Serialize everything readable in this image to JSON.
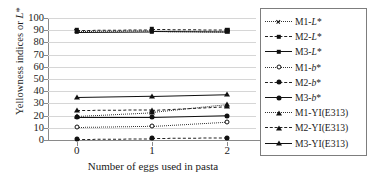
{
  "chart_data": {
    "type": "line",
    "title": "",
    "xlabel": "Number of eggs used in pasta",
    "ylabel": "Yellowness indices or L*",
    "x": [
      0,
      1,
      2
    ],
    "xticklabels": [
      "0",
      "1",
      "2"
    ],
    "yticklabels": [
      "0",
      "10",
      "20",
      "30",
      "40",
      "50",
      "60",
      "70",
      "80",
      "90",
      "100"
    ],
    "ylim": [
      0,
      100
    ],
    "xlim": [
      -0.38,
      2.38
    ],
    "grid": true,
    "legend_position": "right",
    "series": [
      {
        "name": "M1-L*",
        "values": [
          89.0,
          89.5,
          89.0
        ],
        "linestyle": "dotted",
        "marker": "x"
      },
      {
        "name": "M2-L*",
        "values": [
          90.5,
          91.0,
          90.5
        ],
        "linestyle": "dashed",
        "marker": "square"
      },
      {
        "name": "M3-L*",
        "values": [
          88.5,
          89.0,
          88.5
        ],
        "linestyle": "solid",
        "marker": "square"
      },
      {
        "name": "M1-b*",
        "values": [
          10.5,
          11.5,
          15.0
        ],
        "linestyle": "dotted",
        "marker": "circle"
      },
      {
        "name": "M2-b*",
        "values": [
          1.0,
          1.5,
          2.0
        ],
        "linestyle": "dashed",
        "marker": "circle-filled"
      },
      {
        "name": "M3-b*",
        "values": [
          18.5,
          18.5,
          20.0
        ],
        "linestyle": "solid",
        "marker": "circle-filled"
      },
      {
        "name": "M1-YI(E313)",
        "values": [
          20.0,
          23.0,
          29.5
        ],
        "linestyle": "dotted",
        "marker": "triangle"
      },
      {
        "name": "M2-YI(E313)",
        "values": [
          24.5,
          25.0,
          28.0
        ],
        "linestyle": "dashed",
        "marker": "triangle"
      },
      {
        "name": "M3-YI(E313)",
        "values": [
          35.0,
          36.0,
          37.5
        ],
        "linestyle": "solid",
        "marker": "triangle"
      }
    ]
  },
  "axes": {
    "y_title_main": "Yellowness indices or ",
    "y_title_italic": "L",
    "y_title_star": "*",
    "x_title": "Number of eggs used in pasta"
  },
  "legend": {
    "entries": [
      {
        "prefix": "M1-",
        "italic": "L",
        "star": "*",
        "suffix": "",
        "key_line": "dotted",
        "key_marker": "x"
      },
      {
        "prefix": "M2-",
        "italic": "L",
        "star": "*",
        "suffix": "",
        "key_line": "dashed",
        "key_marker": "square"
      },
      {
        "prefix": "M3-",
        "italic": "L",
        "star": "*",
        "suffix": "",
        "key_line": "solid",
        "key_marker": "square"
      },
      {
        "prefix": "M1-",
        "italic": "b",
        "star": "*",
        "suffix": "",
        "key_line": "dotted",
        "key_marker": "circle"
      },
      {
        "prefix": "M2-",
        "italic": "b",
        "star": "*",
        "suffix": "",
        "key_line": "dashed",
        "key_marker": "circle-filled"
      },
      {
        "prefix": "M3-",
        "italic": "b",
        "star": "*",
        "suffix": "",
        "key_line": "solid",
        "key_marker": "circle-filled"
      },
      {
        "prefix": "M1-YI(E313)",
        "italic": "",
        "star": "",
        "suffix": "",
        "key_line": "dotted",
        "key_marker": "triangle"
      },
      {
        "prefix": "M2-YI(E313)",
        "italic": "",
        "star": "",
        "suffix": "",
        "key_line": "dashed",
        "key_marker": "triangle"
      },
      {
        "prefix": "M3-YI(E313)",
        "italic": "",
        "star": "",
        "suffix": "",
        "key_line": "solid",
        "key_marker": "triangle"
      }
    ]
  },
  "colors": {
    "series_ink": "#111111",
    "gridline": "#d6d6d6",
    "axis": "#8a8a8a",
    "legend_border": "#7d7d7d",
    "background": "#ffffff"
  }
}
